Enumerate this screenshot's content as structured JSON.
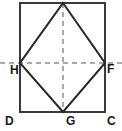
{
  "figure": {
    "type": "geometry-diagram",
    "colors": {
      "background": "#ffffff",
      "stroke": "#262626",
      "rectangle_stroke": "#3a3a3a",
      "dashed_stroke": "#555555",
      "label_color": "#1a1a1a"
    },
    "rectangle": {
      "left": 20,
      "top": 3,
      "right": 105,
      "bottom": 112,
      "stroke_width": 2
    },
    "rhombus": {
      "stroke_width": 2,
      "points": [
        {
          "name": "apex",
          "x": 63,
          "y": 3
        },
        {
          "name": "F",
          "x": 105,
          "y": 63
        },
        {
          "name": "G",
          "x": 63,
          "y": 112
        },
        {
          "name": "H",
          "x": 20,
          "y": 63
        }
      ],
      "path": "63,3 105,63 63,112 20,63"
    },
    "dashed_lines": [
      {
        "name": "horizontal-axis",
        "x1": 0,
        "y1": 63,
        "x2": 122,
        "y2": 63
      },
      {
        "name": "vertical-axis",
        "x1": 63,
        "y1": 3,
        "x2": 63,
        "y2": 112
      }
    ],
    "labels": [
      {
        "id": "H",
        "text": "H",
        "x": 10,
        "y": 64,
        "position": "left-inside"
      },
      {
        "id": "F",
        "text": "F",
        "x": 107,
        "y": 63,
        "position": "right-outside"
      },
      {
        "id": "D",
        "text": "D",
        "x": 5,
        "y": 115,
        "position": "bottom-left"
      },
      {
        "id": "G",
        "text": "G",
        "x": 66,
        "y": 115,
        "position": "bottom-center"
      },
      {
        "id": "C",
        "text": "C",
        "x": 107,
        "y": 115,
        "position": "bottom-right"
      }
    ]
  }
}
